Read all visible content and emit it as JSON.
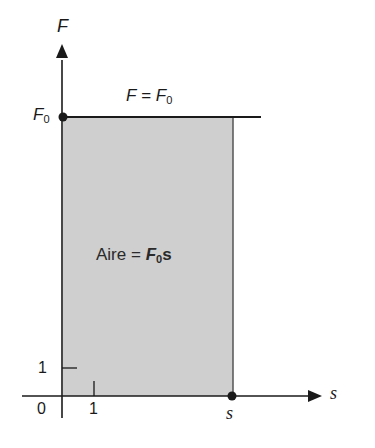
{
  "diagram": {
    "type": "force-displacement graph",
    "y_axis": {
      "label": "F",
      "tick_label": "1"
    },
    "x_axis": {
      "label": "s",
      "tick_label": "1"
    },
    "origin_label": "0",
    "f0_label": "F",
    "f0_sub": "0",
    "line_label_lhs": "F",
    "line_label_eq": "=",
    "line_label_rhs": "F",
    "line_label_rhs_sub": "0",
    "s_point_label": "s",
    "area_label_word": "Aire",
    "area_label_eq": "=",
    "area_label_F": "F",
    "area_label_sub": "0",
    "area_label_s": "s",
    "colors": {
      "shade": "#cfcfcf",
      "ink": "#1a1a1a",
      "background": "#ffffff"
    }
  }
}
